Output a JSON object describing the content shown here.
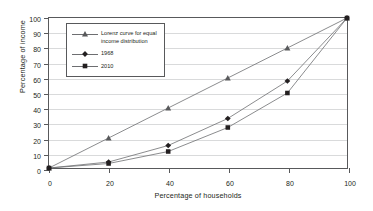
{
  "chart_data": {
    "type": "line",
    "title": "",
    "xlabel": "Percentage of households",
    "ylabel": "Percentage of income",
    "xlim": [
      0,
      100
    ],
    "ylim": [
      0,
      100
    ],
    "xticks": [
      "0",
      "20",
      "40",
      "60",
      "80",
      "100"
    ],
    "yticks": [
      "0",
      "10",
      "20",
      "30",
      "40",
      "50",
      "60",
      "70",
      "80",
      "90",
      "100"
    ],
    "grid": "horizontal",
    "legend_position": "upper-left-inside",
    "x": [
      0,
      20,
      40,
      60,
      80,
      100
    ],
    "series": [
      {
        "name": "Lorenz curve for equal\nincome distribution",
        "marker": "triangle",
        "color": "#58595b",
        "values": [
          0,
          20,
          40,
          60,
          80,
          100
        ]
      },
      {
        "name": "1968",
        "marker": "diamond",
        "color": "#231f20",
        "values": [
          0,
          4,
          15,
          33,
          58,
          100
        ]
      },
      {
        "name": "2010",
        "marker": "square",
        "color": "#231f20",
        "values": [
          0,
          3,
          11,
          27,
          50,
          100
        ]
      }
    ]
  },
  "colors": {
    "frame": "#58595b",
    "grid": "#d9dadb",
    "line": "#6d6e71",
    "text": "#231f20",
    "background": "#ffffff"
  }
}
